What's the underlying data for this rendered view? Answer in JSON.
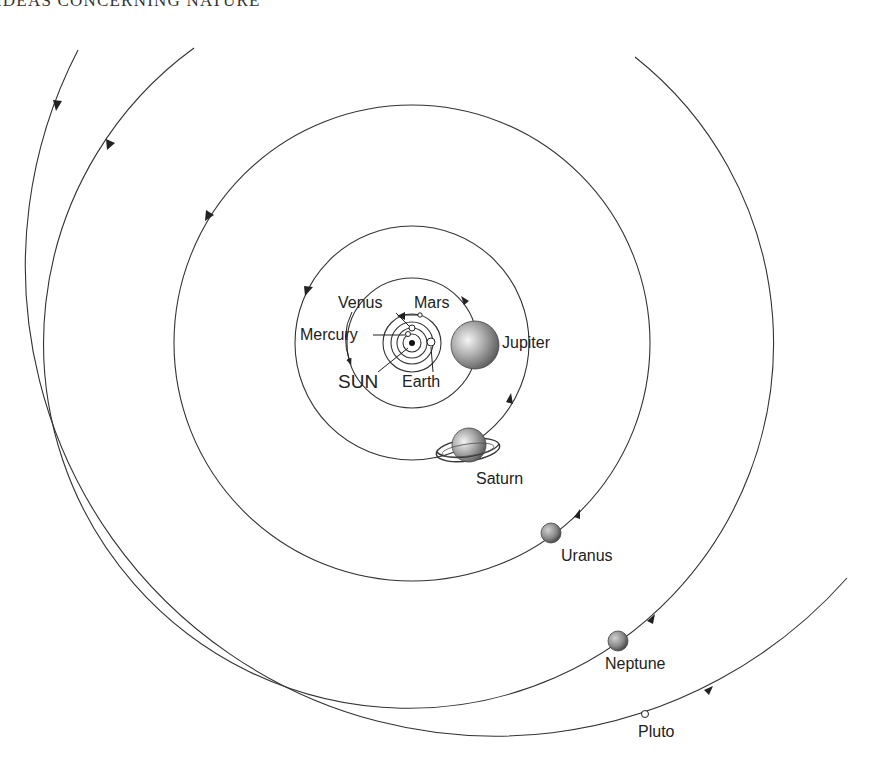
{
  "page": {
    "running_header": "IDEAS CONCERNING NATURE"
  },
  "diagram": {
    "sun": {
      "label": "SUN",
      "x": 412,
      "y": 343
    },
    "planets": [
      {
        "name": "Mercury",
        "label": "Mercury",
        "orbit_r": 10
      },
      {
        "name": "Venus",
        "label": "Venus",
        "orbit_r": 16
      },
      {
        "name": "Earth",
        "label": "Earth",
        "orbit_r": 21
      },
      {
        "name": "Mars",
        "label": "Mars",
        "orbit_r": 29
      },
      {
        "name": "Jupiter",
        "label": "Jupiter",
        "orbit_r": 65
      },
      {
        "name": "Saturn",
        "label": "Saturn",
        "orbit_r": 117
      },
      {
        "name": "Uranus",
        "label": "Uranus",
        "orbit_r": 237
      },
      {
        "name": "Neptune",
        "label": "Neptune",
        "orbit_r": 365
      },
      {
        "name": "Pluto",
        "label": "Pluto",
        "orbit_r": 470,
        "orbit_center": [
          494,
          268
        ]
      }
    ],
    "labels": {
      "venus": "Venus",
      "mars": "Mars",
      "mercury": "Mercury",
      "sun": "SUN",
      "earth": "Earth",
      "jupiter": "Jupiter",
      "saturn": "Saturn",
      "uranus": "Uranus",
      "neptune": "Neptune",
      "pluto": "Pluto"
    },
    "colors": {
      "line": "#333333",
      "text": "#222222",
      "planet_shade": "#8a8a8a"
    }
  }
}
